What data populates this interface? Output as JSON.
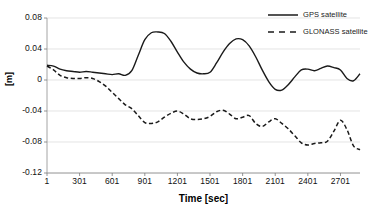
{
  "chart_data": {
    "type": "line",
    "title": "",
    "xlabel": "Time [sec]",
    "ylabel": "[m]",
    "xlim": [
      1,
      2881
    ],
    "ylim": [
      -0.12,
      0.08
    ],
    "grid": true,
    "legend_position": "top-right",
    "x_tick_labels": [
      "1",
      "301",
      "601",
      "901",
      "1201",
      "1501",
      "1801",
      "2101",
      "2401",
      "2701"
    ],
    "x_tick_values": [
      1,
      301,
      601,
      901,
      1201,
      1501,
      1801,
      2101,
      2401,
      2701
    ],
    "y_tick_labels": [
      "0.08",
      "0.04",
      "0",
      "-0.04",
      "-0.08",
      "-0.12"
    ],
    "y_tick_values": [
      0.08,
      0.04,
      0,
      -0.04,
      -0.08,
      -0.12
    ],
    "series": [
      {
        "name": "GPS satellite",
        "style": "solid",
        "color": "#1a1a1a",
        "x": [
          1,
          61,
          121,
          181,
          241,
          301,
          361,
          421,
          481,
          541,
          601,
          661,
          721,
          781,
          841,
          901,
          961,
          1021,
          1081,
          1141,
          1201,
          1261,
          1321,
          1381,
          1441,
          1501,
          1561,
          1621,
          1681,
          1741,
          1801,
          1861,
          1921,
          1981,
          2041,
          2101,
          2161,
          2221,
          2281,
          2341,
          2401,
          2461,
          2521,
          2581,
          2641,
          2701,
          2761,
          2821,
          2881
        ],
        "y": [
          0.019,
          0.018,
          0.014,
          0.012,
          0.011,
          0.01,
          0.011,
          0.01,
          0.009,
          0.008,
          0.007,
          0.008,
          0.006,
          0.012,
          0.032,
          0.052,
          0.061,
          0.062,
          0.06,
          0.05,
          0.036,
          0.023,
          0.014,
          0.009,
          0.008,
          0.01,
          0.022,
          0.036,
          0.047,
          0.053,
          0.052,
          0.044,
          0.03,
          0.013,
          -0.002,
          -0.012,
          -0.013,
          -0.006,
          0.004,
          0.013,
          0.014,
          0.012,
          0.015,
          0.018,
          0.016,
          0.013,
          0.002,
          -0.001,
          0.008
        ]
      },
      {
        "name": "GLONASS satellite",
        "style": "dashed",
        "color": "#1a1a1a",
        "x": [
          1,
          61,
          121,
          181,
          241,
          301,
          361,
          421,
          481,
          541,
          601,
          661,
          721,
          781,
          841,
          901,
          961,
          1021,
          1081,
          1141,
          1201,
          1261,
          1321,
          1381,
          1441,
          1501,
          1561,
          1621,
          1681,
          1741,
          1801,
          1861,
          1921,
          1981,
          2041,
          2101,
          2161,
          2221,
          2281,
          2341,
          2401,
          2461,
          2521,
          2581,
          2641,
          2701,
          2761,
          2821,
          2881
        ],
        "y": [
          0.018,
          0.013,
          0.006,
          0.003,
          0.002,
          0.002,
          0.003,
          0.002,
          -0.002,
          -0.008,
          -0.016,
          -0.024,
          -0.032,
          -0.037,
          -0.046,
          -0.055,
          -0.056,
          -0.054,
          -0.048,
          -0.043,
          -0.04,
          -0.044,
          -0.05,
          -0.051,
          -0.05,
          -0.047,
          -0.041,
          -0.039,
          -0.044,
          -0.05,
          -0.048,
          -0.046,
          -0.056,
          -0.06,
          -0.054,
          -0.05,
          -0.056,
          -0.063,
          -0.072,
          -0.081,
          -0.084,
          -0.082,
          -0.081,
          -0.079,
          -0.066,
          -0.052,
          -0.064,
          -0.085,
          -0.09
        ]
      }
    ]
  },
  "legend": {
    "items": [
      {
        "label": "GPS satellite",
        "style": "solid"
      },
      {
        "label": "GLONASS satellite",
        "style": "dashed"
      }
    ]
  }
}
